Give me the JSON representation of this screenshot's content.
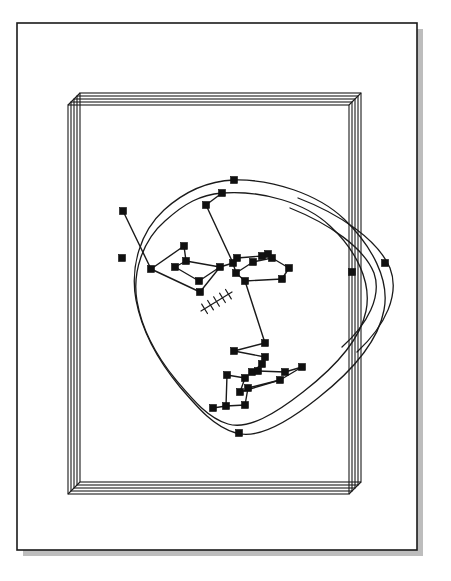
{
  "figure": {
    "background_color": "#ffffff",
    "ink_color": "#1a1a1a",
    "shadow_color": "#b0b0b0",
    "canvas": {
      "width": 451,
      "height": 581
    }
  },
  "outer_page": {
    "name": "outer-page-border",
    "x": 17,
    "y": 23,
    "width": 400,
    "height": 527,
    "stroke_color": "#1a1a1a",
    "stroke_width": 1.6,
    "fill": "#ffffff",
    "shadow": {
      "offset_x": 6,
      "offset_y": 6,
      "color": "#b5b5b5"
    }
  },
  "sheet_stack": {
    "name": "stacked-sheets-frame",
    "sheet_count": 5,
    "sheet_offset_x": -3,
    "sheet_offset_y": 3,
    "base_x": 80,
    "base_y": 93,
    "base_width": 281,
    "base_height": 389,
    "stroke_color": "#1a1a1a",
    "stroke_width": 1.1
  },
  "network": {
    "name": "node-link-network",
    "node_style": {
      "shape": "square",
      "size": 7,
      "fill": "#101010",
      "stroke": "#101010"
    },
    "edge_style": {
      "stroke": "#1a1a1a",
      "stroke_width": 1.4
    },
    "curve_style": {
      "stroke": "#1a1a1a",
      "stroke_width": 1.3,
      "fill": "none"
    },
    "node_count": 40,
    "nodes": [
      {
        "id": "n1",
        "x": 234,
        "y": 180
      },
      {
        "id": "n2",
        "x": 222,
        "y": 193
      },
      {
        "id": "n3",
        "x": 206,
        "y": 205
      },
      {
        "id": "n4",
        "x": 123,
        "y": 211
      },
      {
        "id": "n5",
        "x": 122,
        "y": 258
      },
      {
        "id": "n6",
        "x": 184,
        "y": 246
      },
      {
        "id": "n7",
        "x": 186,
        "y": 261
      },
      {
        "id": "n8",
        "x": 151,
        "y": 269
      },
      {
        "id": "n9",
        "x": 175,
        "y": 267
      },
      {
        "id": "n10",
        "x": 220,
        "y": 267
      },
      {
        "id": "n11",
        "x": 199,
        "y": 281
      },
      {
        "id": "n12",
        "x": 200,
        "y": 292
      },
      {
        "id": "n13",
        "x": 233,
        "y": 263
      },
      {
        "id": "n14",
        "x": 237,
        "y": 258
      },
      {
        "id": "n15",
        "x": 236,
        "y": 273
      },
      {
        "id": "n16",
        "x": 245,
        "y": 281
      },
      {
        "id": "n17",
        "x": 253,
        "y": 262
      },
      {
        "id": "n18",
        "x": 262,
        "y": 256
      },
      {
        "id": "n19",
        "x": 268,
        "y": 254
      },
      {
        "id": "n20",
        "x": 272,
        "y": 258
      },
      {
        "id": "n21",
        "x": 289,
        "y": 268
      },
      {
        "id": "n22",
        "x": 282,
        "y": 279
      },
      {
        "id": "n23",
        "x": 265,
        "y": 343
      },
      {
        "id": "n24",
        "x": 234,
        "y": 351
      },
      {
        "id": "n25",
        "x": 265,
        "y": 357
      },
      {
        "id": "n26",
        "x": 262,
        "y": 364
      },
      {
        "id": "n27",
        "x": 252,
        "y": 372
      },
      {
        "id": "n28",
        "x": 258,
        "y": 371
      },
      {
        "id": "n29",
        "x": 245,
        "y": 378
      },
      {
        "id": "n30",
        "x": 227,
        "y": 375
      },
      {
        "id": "n31",
        "x": 285,
        "y": 372
      },
      {
        "id": "n32",
        "x": 302,
        "y": 367
      },
      {
        "id": "n33",
        "x": 280,
        "y": 380
      },
      {
        "id": "n34",
        "x": 240,
        "y": 392
      },
      {
        "id": "n35",
        "x": 226,
        "y": 406
      },
      {
        "id": "n36",
        "x": 245,
        "y": 405
      },
      {
        "id": "n37",
        "x": 248,
        "y": 388
      },
      {
        "id": "n38",
        "x": 213,
        "y": 408
      },
      {
        "id": "n39",
        "x": 239,
        "y": 433
      },
      {
        "id": "n40",
        "x": 352,
        "y": 272
      },
      {
        "id": "n41",
        "x": 385,
        "y": 263
      }
    ],
    "edges": [
      [
        "n3",
        "n13"
      ],
      [
        "n3",
        "n2"
      ],
      [
        "n4",
        "n8"
      ],
      [
        "n8",
        "n6"
      ],
      [
        "n6",
        "n7"
      ],
      [
        "n7",
        "n9"
      ],
      [
        "n9",
        "n11"
      ],
      [
        "n11",
        "n10"
      ],
      [
        "n10",
        "n7"
      ],
      [
        "n8",
        "n12"
      ],
      [
        "n12",
        "n10"
      ],
      [
        "n10",
        "n13"
      ],
      [
        "n13",
        "n15"
      ],
      [
        "n15",
        "n16"
      ],
      [
        "n16",
        "n23"
      ],
      [
        "n15",
        "n17"
      ],
      [
        "n17",
        "n20"
      ],
      [
        "n20",
        "n19"
      ],
      [
        "n19",
        "n18"
      ],
      [
        "n18",
        "n14"
      ],
      [
        "n14",
        "n13"
      ],
      [
        "n20",
        "n21"
      ],
      [
        "n21",
        "n22"
      ],
      [
        "n22",
        "n16"
      ],
      [
        "n23",
        "n24"
      ],
      [
        "n24",
        "n25"
      ],
      [
        "n25",
        "n26"
      ],
      [
        "n26",
        "n27"
      ],
      [
        "n27",
        "n28"
      ],
      [
        "n28",
        "n31"
      ],
      [
        "n31",
        "n32"
      ],
      [
        "n32",
        "n33"
      ],
      [
        "n33",
        "n34"
      ],
      [
        "n34",
        "n29"
      ],
      [
        "n29",
        "n30"
      ],
      [
        "n30",
        "n35"
      ],
      [
        "n35",
        "n38"
      ],
      [
        "n36",
        "n37"
      ],
      [
        "n37",
        "n33"
      ],
      [
        "n36",
        "n35"
      ]
    ],
    "hatch_mark": {
      "name": "hatched-tick-mark",
      "x1": 201,
      "y1": 311,
      "x2": 232,
      "y2": 292,
      "tick_count": 5,
      "tick_length": 11,
      "stroke": "#1a1a1a",
      "stroke_width": 1.2
    },
    "curves": [
      {
        "name": "outer-loop-curve",
        "d": "M 234 180 C 272 179 318 194 344 219 C 372 246 390 280 384 310 C 378 343 351 372 318 398 C 288 422 258 440 236 433 C 214 427 198 408 180 387 C 160 363 142 332 136 300 C 130 267 140 232 164 210 C 186 190 210 181 234 180 Z"
      },
      {
        "name": "inner-loop-curve",
        "d": "M 222 193 C 262 190 306 203 330 226 C 356 250 372 282 366 311 C 360 341 334 368 303 392 C 275 414 248 430 228 424 C 208 418 193 400 176 380 C 158 358 142 330 137 301 C 132 272 143 240 165 221 C 185 203 200 195 222 193 Z"
      },
      {
        "name": "right-arc-outer",
        "d": "M 298 198 C 340 214 378 240 390 268 C 400 294 386 325 357 352"
      },
      {
        "name": "right-arc-inner",
        "d": "M 290 208 C 330 224 364 248 374 273 C 382 296 368 324 342 347"
      }
    ],
    "curve_nodes": [
      "n4",
      "n5",
      "n39",
      "n40",
      "n41",
      "n1",
      "n2"
    ]
  },
  "labels": {
    "none": ""
  }
}
